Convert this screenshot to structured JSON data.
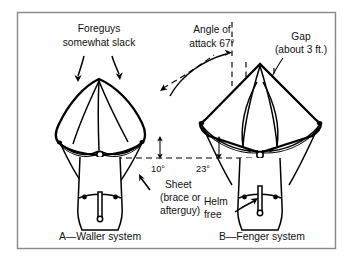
{
  "figure": {
    "border_color": "#888888",
    "ink_color": "#000000",
    "background": "#ffffff"
  },
  "annotations": {
    "foreguys_line1": "Foreguys",
    "foreguys_line2": "somewhat slack",
    "angle_of_attack_line1": "Angle of",
    "angle_of_attack_line2": "attack 67°",
    "gap_line1": "Gap",
    "gap_line2": "(about 3 ft.)",
    "sheet_line1": "Sheet",
    "sheet_line2": "(brace or",
    "sheet_line3": "afterguy)",
    "helm_line1": "Helm",
    "helm_line2": "free",
    "angle_left": "10°",
    "angle_right": "23°"
  },
  "captions": {
    "left": "A—Waller system",
    "right": "B—Fenger system"
  },
  "measurements": {
    "angle_of_attack_deg": 67,
    "gap_feet": 3,
    "waller_angle_deg": 10,
    "fenger_angle_deg": 23
  }
}
